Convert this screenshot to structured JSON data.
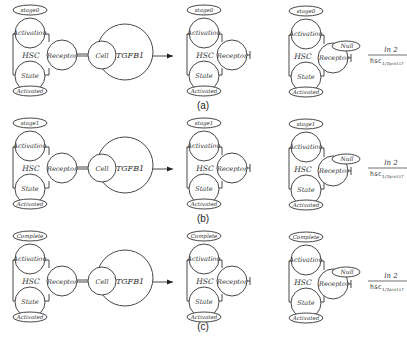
{
  "figure": {
    "panels": [
      {
        "caption": "(a)",
        "stage_label": "stage0",
        "hsc": {
          "label": "HSC",
          "activation": "Activation",
          "receptor": "Receptor",
          "state": "State",
          "state_value": "Activated"
        },
        "cell": {
          "label": "Cell",
          "ligand": "TGFB1"
        },
        "result_hsc": {
          "label": "HSC",
          "activation": "Activation",
          "receptor": "Receptor",
          "state": "State",
          "state_value": "Activated"
        },
        "final_hsc": {
          "label": "HSC",
          "activation": "Activation",
          "receptor": "Receptor",
          "receptor_value": "Null",
          "state": "State",
          "state_value": "Activated"
        },
        "rate": {
          "numerator": "ln 2",
          "denominator": "hsc",
          "subscript": "1/2prolif"
        }
      },
      {
        "caption": "(b)",
        "stage_label": "stage1",
        "hsc": {
          "label": "HSC",
          "activation": "Activation",
          "receptor": "Receptor",
          "state": "State",
          "state_value": "Activated"
        },
        "cell": {
          "label": "Cell",
          "ligand": "TGFB1"
        },
        "result_hsc": {
          "label": "HSC",
          "activation": "Activation",
          "receptor": "Receptor",
          "state": "State",
          "state_value": "Activated"
        },
        "final_hsc": {
          "label": "HSC",
          "activation": "Activation",
          "receptor": "Receptor",
          "receptor_value": "Null",
          "state": "State",
          "state_value": "Activated"
        },
        "rate": {
          "numerator": "ln 2",
          "denominator": "hsc",
          "subscript": "1/2prolif"
        }
      },
      {
        "caption": "(c)",
        "stage_label": "Complete",
        "hsc": {
          "label": "HSC",
          "activation": "Activation",
          "receptor": "Receptor",
          "state": "State",
          "state_value": "Activated"
        },
        "cell": {
          "label": "Cell",
          "ligand": "TGFB1"
        },
        "result_hsc": {
          "label": "HSC",
          "activation": "Activation",
          "receptor": "Receptor",
          "state": "State",
          "state_value": "Activated"
        },
        "final_hsc": {
          "label": "HSC",
          "activation": "Activation",
          "receptor": "Receptor",
          "receptor_value": "Null",
          "state": "State",
          "state_value": "Activated"
        },
        "rate": {
          "numerator": "ln 2",
          "denominator": "hsc",
          "subscript": "1/2prolif"
        }
      }
    ]
  }
}
